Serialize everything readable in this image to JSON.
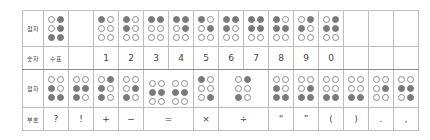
{
  "table": {
    "row_labels": {
      "braille_top": "점자",
      "numbers": "숫자",
      "braille_bottom": "점자",
      "symbols": "부호"
    },
    "number_row": [
      {
        "text": "수표",
        "dots": [
          3,
          4,
          5,
          6
        ]
      },
      {
        "text": "",
        "dots": null
      },
      {
        "text": "1",
        "dots": [
          1
        ]
      },
      {
        "text": "2",
        "dots": [
          1,
          2
        ]
      },
      {
        "text": "3",
        "dots": [
          1,
          4
        ]
      },
      {
        "text": "4",
        "dots": [
          1,
          4,
          5
        ]
      },
      {
        "text": "5",
        "dots": [
          1,
          5
        ]
      },
      {
        "text": "6",
        "dots": [
          1,
          2,
          4
        ]
      },
      {
        "text": "7",
        "dots": [
          1,
          2,
          4,
          5
        ]
      },
      {
        "text": "8",
        "dots": [
          1,
          2,
          5
        ]
      },
      {
        "text": "9",
        "dots": [
          2,
          4
        ]
      },
      {
        "text": "0",
        "dots": [
          2,
          4,
          5
        ]
      },
      {
        "text": "",
        "dots": null
      },
      {
        "text": "",
        "dots": null
      },
      {
        "text": "",
        "dots": null
      }
    ],
    "symbol_row": [
      {
        "text": "?",
        "dots": [
          2,
          3,
          6
        ]
      },
      {
        "text": "!",
        "dots": [
          2,
          3,
          5
        ]
      },
      {
        "text": "+",
        "dots": [
          2,
          3,
          4
        ]
      },
      {
        "text": "−",
        "dots": [
          3,
          5
        ]
      },
      {
        "text": "=",
        "dots": [
          2,
          5
        ],
        "dots2": [
          2,
          5
        ]
      },
      {
        "text": "×",
        "dots": [
          1,
          6
        ]
      },
      {
        "text": "÷",
        "dots": [
          3,
          4
        ]
      },
      {
        "text": "“",
        "dots": [
          2,
          3,
          6
        ]
      },
      {
        "text": "”",
        "dots": [
          3,
          5,
          6
        ]
      },
      {
        "text": "(",
        "dots": [
          3,
          6
        ]
      },
      {
        "text": ")",
        "dots": [
          3,
          6
        ]
      },
      {
        "text": ".",
        "dots": [
          5
        ]
      },
      {
        "text": ",",
        "dots": [
          2,
          5,
          6
        ]
      }
    ]
  }
}
